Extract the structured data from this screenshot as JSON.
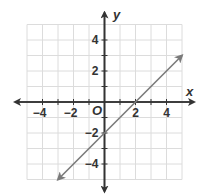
{
  "chart_data": {
    "type": "line",
    "title": "",
    "xlabel": "x",
    "ylabel": "y",
    "origin_label": "O",
    "xlim": [
      -5,
      5
    ],
    "ylim": [
      -5,
      5
    ],
    "grid": true,
    "grid_step": 1,
    "x_ticks": [
      -4,
      -2,
      2,
      4
    ],
    "y_ticks": [
      4,
      2,
      -2,
      -4
    ],
    "x_tick_labels": [
      "−4",
      "−2",
      "2",
      "4"
    ],
    "y_tick_labels": [
      "4",
      "2",
      "−2",
      "−4"
    ],
    "series": [
      {
        "name": "y = x − 2",
        "equation": "y = x - 2",
        "slope": 1,
        "y_intercept": -2,
        "x_intercept": 2,
        "x": [
          -3,
          5
        ],
        "y": [
          -5,
          3
        ],
        "arrows_both_ends": true,
        "color": "#7a7a7a"
      }
    ],
    "colors": {
      "axis": "#333333",
      "grid": "#dcdcdc",
      "line": "#7a7a7a",
      "text": "#333333"
    }
  }
}
